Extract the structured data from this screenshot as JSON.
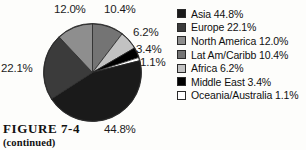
{
  "figure": {
    "caption_title": "FIGURE 7-4",
    "caption_sub": "(continued)"
  },
  "legend": {
    "items": [
      {
        "label": "Asia 44.8%",
        "swatch": "#1a1a1a",
        "name": "Asia"
      },
      {
        "label": "Europe 22.1%",
        "swatch": "#3b3b3b",
        "name": "Europe"
      },
      {
        "label": "North America 12.0%",
        "swatch": "#8e8e8e",
        "name": "North America"
      },
      {
        "label": "Lat Am/Caribb 10.4%",
        "swatch": "#747474",
        "name": "Lat Am/Caribb"
      },
      {
        "label": "Africa 6.2%",
        "swatch": "#c2c2c2",
        "name": "Africa"
      },
      {
        "label": "Middle East 3.4%",
        "swatch": "#000000",
        "name": "Middle East"
      },
      {
        "label": "Oceania/Australia 1.1%",
        "swatch": "#ffffff",
        "name": "Oceania/Australia"
      }
    ]
  },
  "callouts": {
    "north_america": "12.0%",
    "lat_am_caribb": "10.4%",
    "africa": "6.2%",
    "middle_east": "3.4%",
    "oceania": "1.1%",
    "europe": "22.1%",
    "asia": "44.8%"
  },
  "chart_data": {
    "type": "pie",
    "title": "FIGURE 7-4",
    "subtitle": "(continued)",
    "legend_position": "right",
    "start_angle_deg": 0,
    "direction": "clockwise",
    "center": [
      49.5,
      49.5
    ],
    "radius": 49,
    "labels": [
      "Lat Am/Caribb",
      "Africa",
      "Middle East",
      "Oceania/Australia",
      "Asia",
      "Europe",
      "North America"
    ],
    "values": [
      10.4,
      6.2,
      3.4,
      1.1,
      44.8,
      22.1,
      12.0
    ],
    "colors": [
      "#747474",
      "#c2c2c2",
      "#000000",
      "#ffffff",
      "#1a1a1a",
      "#3b3b3b",
      "#8e8e8e"
    ],
    "value_labels": [
      "10.4%",
      "6.2%",
      "3.4%",
      "1.1%",
      "44.8%",
      "22.1%",
      "12.0%"
    ],
    "legend_order_labels": [
      "Asia",
      "Europe",
      "North America",
      "Lat Am/Caribb",
      "Africa",
      "Middle East",
      "Oceania/Australia"
    ],
    "legend_order_values": [
      44.8,
      22.1,
      12.0,
      10.4,
      6.2,
      3.4,
      1.1
    ],
    "total": 100.0,
    "units": "percent"
  }
}
